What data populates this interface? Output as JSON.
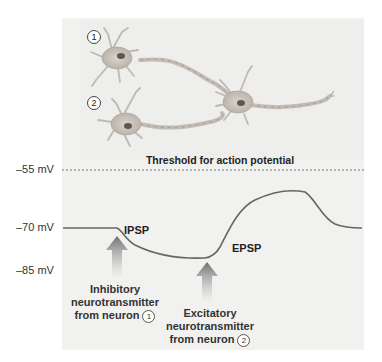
{
  "diagram": {
    "neurons": [
      {
        "id": "1",
        "label": "1",
        "role": "presynaptic inhibitory"
      },
      {
        "id": "2",
        "label": "2",
        "role": "presynaptic excitatory"
      },
      {
        "id": "3",
        "label": "",
        "role": "postsynaptic"
      }
    ],
    "threshold_title": "Threshold for action potential",
    "axis_labels": {
      "threshold": "–55 mV",
      "resting": "–70 mV",
      "hyperpolarized": "–85 mV"
    },
    "curve_labels": {
      "ipsp": "IPSP",
      "epsp": "EPSP"
    },
    "captions": {
      "inhibitory": {
        "line1": "Inhibitory",
        "line2": "neurotransmitter",
        "line3": "from neuron",
        "num": "1"
      },
      "excitatory": {
        "line1": "Excitatory",
        "line2": "neurotransmitter",
        "line3": "from neuron",
        "num": "2"
      }
    },
    "colors": {
      "curve": "#6b6560",
      "arrow": "#7a7a7a",
      "panel": "#f1f1f0",
      "neuron_body": "#c9c4bd"
    }
  }
}
